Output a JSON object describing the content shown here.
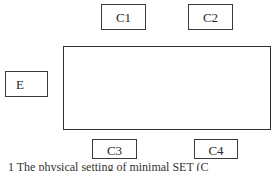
{
  "diagram": {
    "type": "block-layout",
    "nodes": [
      {
        "id": "C1",
        "label": "C1",
        "position": "top-left"
      },
      {
        "id": "C2",
        "label": "C2",
        "position": "top-right"
      },
      {
        "id": "E",
        "label": "E",
        "position": "left"
      },
      {
        "id": "C3",
        "label": "C3",
        "position": "bottom-left"
      },
      {
        "id": "C4",
        "label": "C4",
        "position": "bottom-right"
      }
    ],
    "center_region": {
      "label": ""
    },
    "caption": "1 The physical setting of minimal SET (C"
  },
  "colors": {
    "stroke": "#3a3a3a",
    "background": "#ffffff",
    "text": "#2a2a2a"
  }
}
